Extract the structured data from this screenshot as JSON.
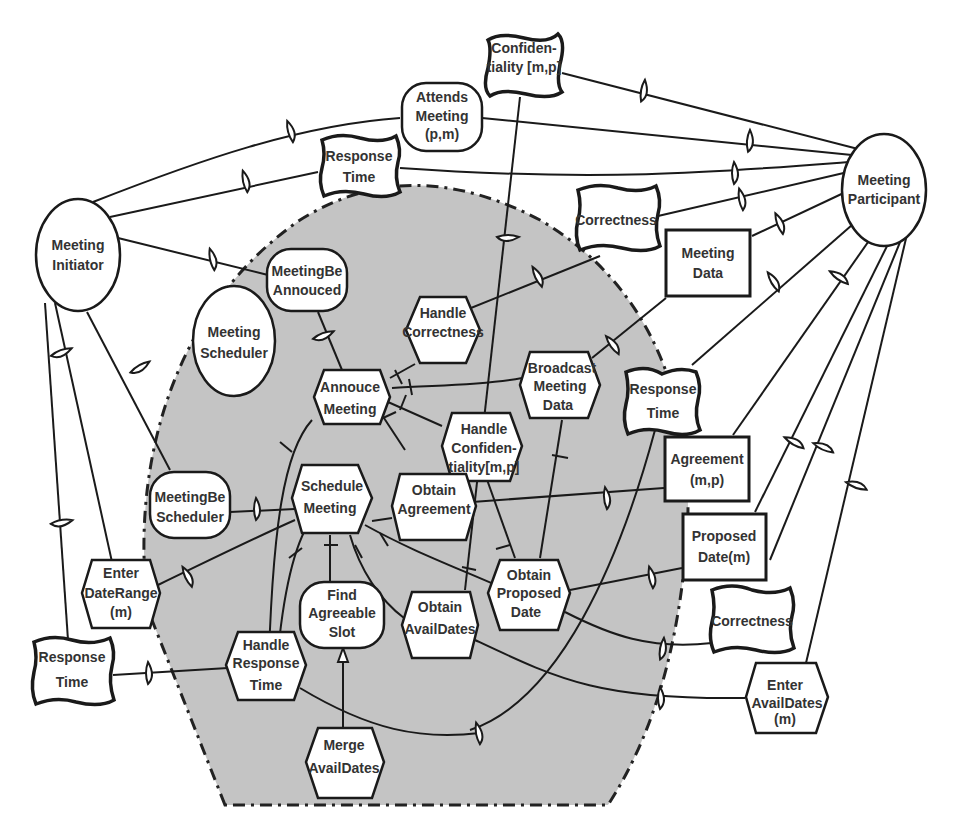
{
  "diagram": {
    "actors": {
      "meeting_initiator": {
        "label": [
          "Meeting",
          "Initiator"
        ]
      },
      "meeting_participant": {
        "label": [
          "Meeting",
          "Participant"
        ]
      },
      "meeting_scheduler": {
        "label": [
          "Meeting",
          "Scheduler"
        ]
      }
    },
    "goals": {
      "meeting_be_annouced": {
        "label": [
          "MeetingBe",
          "Annouced"
        ]
      },
      "meeting_be_scheduler": {
        "label": [
          "MeetingBe",
          "Scheduler"
        ]
      },
      "find_agreeable_slot": {
        "label": [
          "Find",
          "Agreeable",
          "Slot"
        ]
      }
    },
    "softgoals": {
      "confidentiality": {
        "label": [
          "Confiden-",
          "tiality [m,p]"
        ]
      },
      "attends_meeting": {
        "label": [
          "Attends",
          "Meeting",
          "(p,m)"
        ]
      },
      "response_time_top": {
        "label": [
          "Response",
          "Time"
        ]
      },
      "correctness_top": {
        "label": [
          "Correctness"
        ]
      },
      "response_time_right": {
        "label": [
          "Response",
          "Time"
        ]
      },
      "correctness_bottom": {
        "label": [
          "Correctness"
        ]
      },
      "response_time_left": {
        "label": [
          "Response",
          "Time"
        ]
      }
    },
    "resources": {
      "meeting_data": {
        "label": [
          "Meeting",
          "Data"
        ]
      },
      "agreement": {
        "label": [
          "Agreement",
          "(m,p)"
        ]
      },
      "proposed_date": {
        "label": [
          "Proposed",
          "Date(m)"
        ]
      }
    },
    "tasks": {
      "handle_correctness": {
        "label": [
          "Handle",
          "Correctness"
        ]
      },
      "annouce_meeting": {
        "label": [
          "Annouce",
          "Meeting"
        ]
      },
      "broadcast_meeting_data": {
        "label": [
          "Broadcast",
          "Meeting",
          "Data"
        ]
      },
      "handle_confidentiality": {
        "label": [
          "Handle",
          "Confiden-",
          "tiality[m,p]"
        ]
      },
      "schedule_meeting": {
        "label": [
          "Schedule",
          "Meeting"
        ]
      },
      "obtain_agreement": {
        "label": [
          "Obtain",
          "Agreement"
        ]
      },
      "enter_date_range": {
        "label": [
          "Enter",
          "DateRange",
          "(m)"
        ]
      },
      "obtain_proposed_date": {
        "label": [
          "Obtain",
          "Proposed",
          "Date"
        ]
      },
      "obtain_avail_dates": {
        "label": [
          "Obtain",
          "AvailDates"
        ]
      },
      "handle_response_time": {
        "label": [
          "Handle",
          "Response",
          "Time"
        ]
      },
      "merge_avail_dates": {
        "label": [
          "Merge",
          "AvailDates"
        ]
      },
      "enter_avail_dates": {
        "label": [
          "Enter",
          "AvailDates",
          "(m)"
        ]
      }
    },
    "colors": {
      "boundary_fill": "#c4c4c4",
      "stroke": "#1a1a1a",
      "node_fill": "#ffffff",
      "text": "#333333"
    }
  }
}
